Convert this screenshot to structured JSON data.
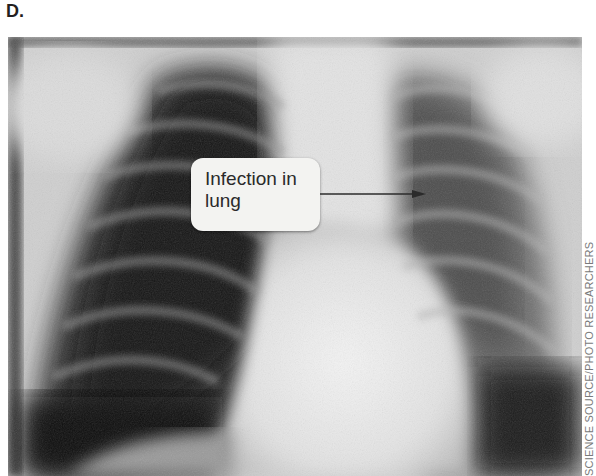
{
  "figure": {
    "panel_label": "D.",
    "image": {
      "subject": "chest-xray",
      "description": "Frontal chest radiograph showing lungs, ribs and heart"
    },
    "callout": {
      "line1": "Infection in",
      "line2": "lung"
    },
    "credit": "SCIENCE SOURCE/PHOTO RESEARCHERS"
  }
}
